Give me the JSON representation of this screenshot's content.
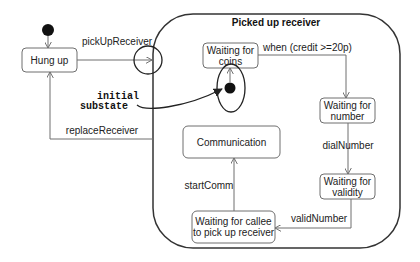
{
  "diagram": {
    "type": "UML state machine",
    "composite_state": {
      "title": "Picked up receiver"
    },
    "states": {
      "hung_up": "Hung up",
      "waiting_coins_1": "Waiting for",
      "waiting_coins_2": "coins",
      "waiting_number_1": "Waiting for",
      "waiting_number_2": "number",
      "waiting_validity_1": "Waiting for",
      "waiting_validity_2": "validity",
      "waiting_callee_1": "Waiting for callee",
      "waiting_callee_2": "to pick up receiver",
      "communication": "Communication"
    },
    "transitions": {
      "pick_up": "pickUpReceiver",
      "when_credit": "when (credit >=20p)",
      "dial_number": "dialNumber",
      "valid_number": "validNumber",
      "start_comm": "startComm",
      "replace_receiver": "replaceReceiver"
    },
    "annotation": {
      "line1": "initial",
      "line2": "substate"
    },
    "colors": {
      "stroke": "#6e6e6e",
      "dark_stroke": "#222222",
      "text": "#222222",
      "background": "#ffffff"
    }
  }
}
